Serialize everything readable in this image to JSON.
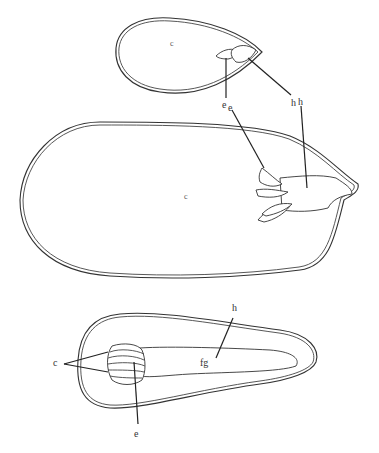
{
  "figure": {
    "colors": {
      "line": "#333333",
      "background": "#ffffff"
    }
  },
  "panels": [
    {
      "id": "top-seed",
      "labels": {
        "interior": "c",
        "embryo": "e",
        "hypocotyl": "h"
      }
    },
    {
      "id": "middle-seed",
      "labels": {
        "interior": "c",
        "embryo": "e",
        "hypocotyl": "h"
      }
    },
    {
      "id": "bottom-seed",
      "labels": {
        "cotyledons": "c",
        "embryo": "e",
        "hypocotyl": "h",
        "feeding_region": "fg"
      }
    }
  ]
}
